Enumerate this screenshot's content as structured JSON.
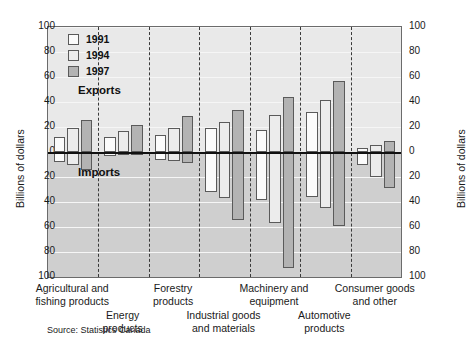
{
  "chart_data": {
    "type": "bar",
    "title": "",
    "subtitle": "",
    "xlabel": "",
    "ylabel": "Billions of dollars",
    "ylabel_right": "Billions of dollars",
    "ylim": [
      -100,
      100
    ],
    "ytick_labels": [
      "100",
      "80",
      "60",
      "40",
      "20",
      "0",
      "20",
      "40",
      "60",
      "80",
      "100"
    ],
    "ytick_values": [
      100,
      80,
      60,
      40,
      20,
      0,
      -20,
      -40,
      -60,
      -80,
      -100
    ],
    "grid": true,
    "legend_position": "top-left",
    "annotations": [
      "Exports",
      "Imports"
    ],
    "note": "Values above the zero line are exports; values below the zero line are imports (plotted as negative).",
    "categories": [
      "Agricultural and fishing products",
      "Energy products",
      "Forestry products",
      "Industrial goods and materials",
      "Machinery and equipment",
      "Automotive products",
      "Consumer goods and other"
    ],
    "series": [
      {
        "name": "1991",
        "exports": [
          12,
          12,
          14,
          19,
          18,
          32,
          3
        ],
        "imports": [
          -8,
          -3,
          -6,
          -32,
          -38,
          -36,
          -10
        ]
      },
      {
        "name": "1994",
        "exports": [
          19,
          17,
          19,
          24,
          30,
          42,
          6
        ],
        "imports": [
          -10,
          -2,
          -7,
          -37,
          -57,
          -45,
          -20
        ]
      },
      {
        "name": "1997",
        "exports": [
          26,
          22,
          29,
          34,
          44,
          57,
          9
        ],
        "imports": [
          -14,
          -2,
          -9,
          -54,
          -93,
          -59,
          -29
        ]
      }
    ]
  },
  "axes": {
    "left_title": "Billions of dollars",
    "right_title": "Billions of dollars"
  },
  "legend": {
    "items": [
      {
        "label": "1991",
        "color": "#fbfbfb"
      },
      {
        "label": "1994",
        "color": "#ececec"
      },
      {
        "label": "1997",
        "color": "#b3b3b3"
      }
    ]
  },
  "annotations": {
    "exports": "Exports",
    "imports": "Imports"
  },
  "category_labels": [
    {
      "line1": "Agricultural and",
      "line2": "fishing products"
    },
    {
      "line1": "Energy",
      "line2": "products"
    },
    {
      "line1": "Forestry",
      "line2": "products"
    },
    {
      "line1": "Industrial goods",
      "line2": "and materials"
    },
    {
      "line1": "Machinery and",
      "line2": "equipment"
    },
    {
      "line1": "Automotive",
      "line2": "products"
    },
    {
      "line1": "Consumer goods",
      "line2": "and other"
    }
  ],
  "source": "Source: Statistics Canada"
}
